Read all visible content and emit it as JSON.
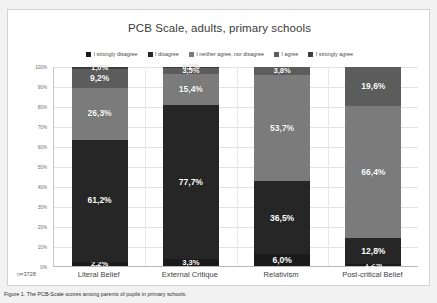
{
  "figure": {
    "background_color": "#f2f2f2",
    "panel_color": "#ffffff",
    "caption": "Figure 1. The PCB-Scale scores among parents of pupils in primary schools."
  },
  "chart_data": {
    "type": "bar",
    "subtype": "stacked-100-percent",
    "title": "PCB Scale, adults, primary schools",
    "xlabel": "",
    "ylabel": "",
    "ylim": [
      0,
      100
    ],
    "grid": true,
    "legend_position": "top",
    "sample_size_label": "n=3728",
    "categories": [
      "Literal Belief",
      "External Critique",
      "Relativism",
      "Post-critical Belief"
    ],
    "tick_labels": [
      "0%",
      "10%",
      "20%",
      "30%",
      "40%",
      "50%",
      "60%",
      "70%",
      "80%",
      "90%",
      "100%"
    ],
    "tick_values": [
      0,
      10,
      20,
      30,
      40,
      50,
      60,
      70,
      80,
      90,
      100
    ],
    "series": [
      {
        "name": "I strongly disagree",
        "color": "#1a1a1a",
        "values": [
          2.2,
          3.3,
          6.0,
          1.2
        ],
        "labels": [
          "2,2%",
          "3,3%",
          "6,0%",
          "1,2%"
        ]
      },
      {
        "name": "I disagree",
        "color": "#262626",
        "values": [
          61.2,
          77.7,
          36.5,
          12.8
        ],
        "labels": [
          "61,2%",
          "77,7%",
          "36,5%",
          "12,8%"
        ]
      },
      {
        "name": "I neither agree, nor disagree",
        "color": "#7b7b7b",
        "values": [
          26.3,
          15.4,
          53.7,
          66.4
        ],
        "labels": [
          "26,3%",
          "15,4%",
          "53,7%",
          "66,4%"
        ]
      },
      {
        "name": "I agree",
        "color": "#5c5c5c",
        "values": [
          9.2,
          3.5,
          3.8,
          19.6
        ],
        "labels": [
          "9,2%",
          "3,5%",
          "3,8%",
          "19,6%"
        ]
      },
      {
        "name": "I strongly agree",
        "color": "#3d3d3d",
        "values": [
          1.0,
          0.2,
          0.0,
          0.0
        ],
        "labels": [
          "1,0%",
          "0,2%",
          "",
          ""
        ]
      }
    ]
  }
}
